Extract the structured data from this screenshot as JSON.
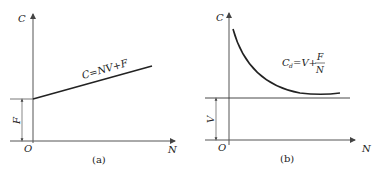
{
  "panels": [
    {
      "id": "a",
      "caption": "(a)",
      "y_axis_label": "C",
      "x_axis_label": "N",
      "origin_label": "O",
      "intercept_label": "F",
      "curve_label": "C=NV+F",
      "curve_type": "linear"
    },
    {
      "id": "b",
      "caption": "(b)",
      "y_axis_label": "C",
      "x_axis_label": "N",
      "origin_label": "O",
      "asymptote_label": "V",
      "curve_label_main": "C",
      "curve_label_sub": "d",
      "curve_label_rest": "=V+",
      "curve_label_num": "F",
      "curve_label_den": "N",
      "curve_type": "hyperbolic"
    }
  ],
  "colors": {
    "stroke": "#222222",
    "axis": "#555555"
  }
}
